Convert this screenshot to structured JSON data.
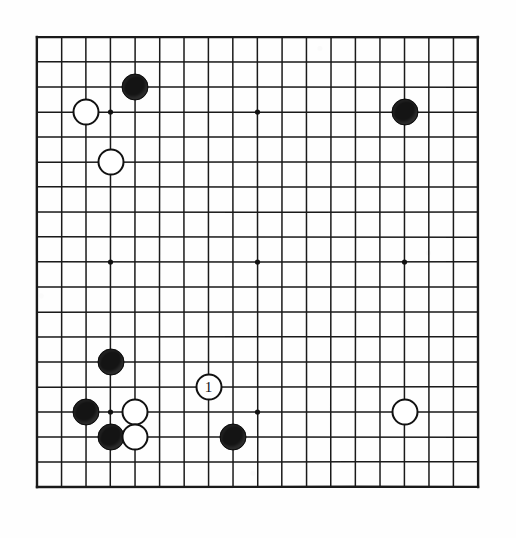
{
  "document": {
    "type": "go-board-diagram",
    "caption": ""
  },
  "board": {
    "name": "go-board",
    "size": 19,
    "columns": 19,
    "rows": 19,
    "line_color": "#1a1a1a",
    "board_color": "#ffffff",
    "star_point_color": "#111111",
    "star_points": [
      {
        "col": 4,
        "row": 4
      },
      {
        "col": 10,
        "row": 4
      },
      {
        "col": 16,
        "row": 4
      },
      {
        "col": 4,
        "row": 10
      },
      {
        "col": 10,
        "row": 10
      },
      {
        "col": 16,
        "row": 10
      },
      {
        "col": 4,
        "row": 16
      },
      {
        "col": 10,
        "row": 16
      },
      {
        "col": 16,
        "row": 16
      }
    ]
  },
  "stones": [
    {
      "name": "stone-black-e3",
      "color": "black",
      "col": 5,
      "row": 3,
      "label": ""
    },
    {
      "name": "stone-white-c4",
      "color": "white",
      "col": 3,
      "row": 4,
      "label": ""
    },
    {
      "name": "stone-black-q4",
      "color": "black",
      "col": 16,
      "row": 4,
      "label": ""
    },
    {
      "name": "stone-white-d6",
      "color": "white",
      "col": 4,
      "row": 6,
      "label": ""
    },
    {
      "name": "stone-black-d14",
      "color": "black",
      "col": 4,
      "row": 14,
      "label": ""
    },
    {
      "name": "stone-white-h15",
      "color": "white",
      "col": 8,
      "row": 15,
      "label": "1"
    },
    {
      "name": "stone-black-c16",
      "color": "black",
      "col": 3,
      "row": 16,
      "label": ""
    },
    {
      "name": "stone-white-e16",
      "color": "white",
      "col": 5,
      "row": 16,
      "label": ""
    },
    {
      "name": "stone-white-q16",
      "color": "white",
      "col": 16,
      "row": 16,
      "label": ""
    },
    {
      "name": "stone-black-d17",
      "color": "black",
      "col": 4,
      "row": 17,
      "label": ""
    },
    {
      "name": "stone-white-e17",
      "color": "white",
      "col": 5,
      "row": 17,
      "label": ""
    },
    {
      "name": "stone-black-j17",
      "color": "black",
      "col": 9,
      "row": 17,
      "label": ""
    }
  ],
  "geometry": {
    "origin_x": 0,
    "origin_y": 0,
    "step_x": 24.5,
    "step_y": 25.0,
    "stone_diameter": 27
  }
}
